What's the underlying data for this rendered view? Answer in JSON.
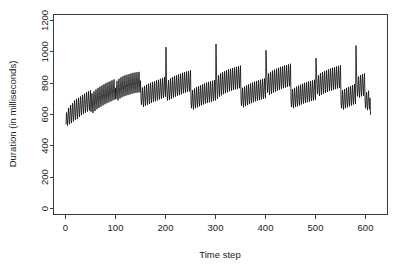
{
  "chart_data": {
    "type": "line",
    "title": "",
    "subtitle": "",
    "xlabel": "Time step",
    "ylabel": "Duration (in milliseconds)",
    "xlim": [
      0,
      620
    ],
    "ylim": [
      0,
      1200
    ],
    "xticks": [
      0,
      100,
      200,
      300,
      400,
      500,
      600
    ],
    "yticks": [
      0,
      200,
      400,
      600,
      800,
      1000,
      1200
    ],
    "xtick_labels": [
      "0",
      "100",
      "200",
      "300",
      "400",
      "500",
      "600"
    ],
    "ytick_labels": [
      "0",
      "200",
      "400",
      "600",
      "800",
      "1000",
      "1200"
    ],
    "grid": false,
    "legend": null,
    "legend_position": "none",
    "line_color": "#111111",
    "axis_color": "#3a3a3a",
    "background_color": "#ffffff",
    "n_points": 600,
    "annotations": [],
    "series": [
      {
        "name": "duration",
        "x_start": 1,
        "x_step": 1,
        "values": [
          540,
          612,
          568,
          529,
          596,
          642,
          575,
          538,
          607,
          660,
          588,
          545,
          622,
          672,
          601,
          556,
          634,
          689,
          612,
          567,
          641,
          700,
          618,
          572,
          651,
          706,
          630,
          584,
          662,
          715,
          641,
          596,
          672,
          724,
          650,
          604,
          680,
          733,
          658,
          612,
          688,
          742,
          666,
          619,
          695,
          748,
          673,
          626,
          701,
          755,
          618,
          680,
          735,
          654,
          610,
          690,
          748,
          666,
          622,
          702,
          760,
          678,
          634,
          712,
          770,
          688,
          642,
          720,
          778,
          696,
          650,
          728,
          786,
          704,
          658,
          735,
          793,
          711,
          665,
          742,
          800,
          718,
          672,
          748,
          806,
          724,
          678,
          754,
          812,
          730,
          684,
          760,
          818,
          736,
          690,
          766,
          824,
          742,
          696,
          770,
          700,
          760,
          815,
          735,
          690,
          770,
          828,
          748,
          702,
          780,
          838,
          756,
          710,
          788,
          845,
          762,
          716,
          792,
          850,
          768,
          720,
          796,
          854,
          772,
          724,
          800,
          858,
          776,
          728,
          804,
          862,
          780,
          732,
          808,
          866,
          784,
          736,
          810,
          868,
          786,
          738,
          812,
          870,
          788,
          740,
          814,
          872,
          790,
          742,
          816,
          700,
          662,
          718,
          772,
          692,
          648,
          726,
          782,
          700,
          656,
          732,
          790,
          708,
          662,
          740,
          796,
          714,
          668,
          746,
          802,
          720,
          674,
          750,
          808,
          726,
          680,
          756,
          812,
          730,
          684,
          760,
          818,
          736,
          690,
          766,
          822,
          742,
          696,
          772,
          828,
          748,
          700,
          778,
          834,
          752,
          706,
          782,
          840,
          758,
          712,
          1030,
          800,
          740,
          690,
          760,
          820,
          740,
          694,
          770,
          830,
          748,
          700,
          778,
          838,
          756,
          708,
          786,
          846,
          762,
          714,
          790,
          850,
          768,
          720,
          796,
          856,
          772,
          724,
          800,
          860,
          778,
          730,
          806,
          866,
          784,
          736,
          810,
          870,
          788,
          740,
          814,
          874,
          792,
          744,
          818,
          878,
          796,
          748,
          822,
          882,
          680,
          640,
          700,
          756,
          676,
          632,
          710,
          766,
          684,
          640,
          716,
          774,
          690,
          646,
          722,
          780,
          696,
          652,
          728,
          786,
          702,
          658,
          734,
          792,
          708,
          664,
          740,
          798,
          714,
          670,
          746,
          804,
          718,
          674,
          750,
          808,
          722,
          678,
          754,
          812,
          726,
          682,
          758,
          816,
          730,
          686,
          762,
          820,
          734,
          690,
          1050,
          860,
          760,
          700,
          790,
          850,
          770,
          714,
          800,
          862,
          778,
          722,
          808,
          870,
          786,
          730,
          814,
          876,
          792,
          736,
          820,
          882,
          798,
          742,
          826,
          888,
          804,
          748,
          832,
          892,
          808,
          752,
          836,
          896,
          812,
          756,
          840,
          900,
          816,
          760,
          844,
          904,
          820,
          764,
          848,
          908,
          824,
          768,
          852,
          912,
          700,
          656,
          714,
          770,
          690,
          646,
          722,
          778,
          698,
          654,
          730,
          786,
          704,
          660,
          736,
          792,
          710,
          666,
          742,
          798,
          716,
          672,
          748,
          804,
          722,
          678,
          754,
          810,
          728,
          684,
          758,
          814,
          732,
          688,
          762,
          818,
          736,
          692,
          766,
          822,
          740,
          696,
          770,
          826,
          744,
          700,
          774,
          830,
          748,
          704,
          1010,
          900,
          810,
          740,
          800,
          862,
          780,
          726,
          812,
          872,
          788,
          732,
          818,
          880,
          794,
          740,
          824,
          886,
          800,
          746,
          830,
          892,
          806,
          752,
          836,
          898,
          812,
          758,
          842,
          904,
          818,
          764,
          848,
          908,
          822,
          768,
          852,
          912,
          826,
          772,
          856,
          916,
          830,
          776,
          860,
          920,
          834,
          780,
          864,
          924,
          690,
          648,
          706,
          762,
          682,
          640,
          714,
          770,
          690,
          648,
          722,
          778,
          696,
          652,
          728,
          784,
          702,
          658,
          734,
          790,
          708,
          664,
          740,
          796,
          714,
          670,
          746,
          802,
          718,
          674,
          750,
          806,
          722,
          678,
          754,
          810,
          726,
          682,
          758,
          814,
          730,
          686,
          762,
          818,
          734,
          690,
          766,
          822,
          738,
          694,
          960,
          870,
          790,
          730,
          790,
          850,
          772,
          718,
          804,
          864,
          780,
          726,
          810,
          870,
          786,
          732,
          816,
          876,
          792,
          738,
          822,
          882,
          798,
          744,
          828,
          888,
          804,
          750,
          834,
          894,
          808,
          754,
          838,
          898,
          812,
          758,
          842,
          902,
          816,
          762,
          846,
          906,
          820,
          766,
          850,
          910,
          824,
          770,
          854,
          914,
          680,
          640,
          698,
          754,
          674,
          632,
          706,
          762,
          682,
          640,
          714,
          770,
          688,
          646,
          720,
          776,
          694,
          652,
          726,
          782,
          700,
          658,
          732,
          788,
          706,
          664,
          738,
          794,
          710,
          668,
          1040,
          880,
          780,
          716,
          782,
          842,
          760,
          708,
          794,
          852,
          770,
          716,
          800,
          858,
          776,
          720,
          804,
          862,
          700,
          640,
          688,
          742,
          668,
          628,
          700,
          752,
          676,
          634,
          706,
          600
        ]
      }
    ]
  },
  "axes": {
    "y_label": "Duration (in milliseconds)",
    "x_label": "Time step"
  }
}
